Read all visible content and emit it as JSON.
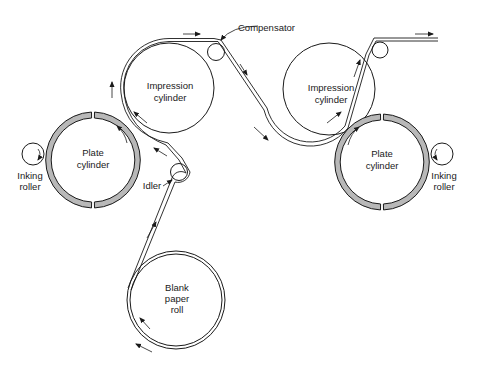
{
  "diagram": {
    "type": "printing-press-schematic",
    "colors": {
      "line": "#1a1a1a",
      "plate_fill": "#b8b8b8",
      "background": "#ffffff"
    },
    "labels": {
      "compensator": "Compensator",
      "idler": "Idler",
      "impression_left_1": "Impression",
      "impression_left_2": "cylinder",
      "impression_right_1": "Impression",
      "impression_right_2": "cylinder",
      "plate_left_1": "Plate",
      "plate_left_2": "cylinder",
      "plate_right_1": "Plate",
      "plate_right_2": "cylinder",
      "inking_left_1": "Inking",
      "inking_left_2": "roller",
      "inking_right_1": "Inking",
      "inking_right_2": "roller",
      "blank_1": "Blank",
      "blank_2": "paper",
      "blank_3": "roll"
    },
    "components": [
      {
        "id": "blank-paper-roll",
        "label": "Blank paper roll"
      },
      {
        "id": "idler",
        "label": "Idler"
      },
      {
        "id": "impression-cylinder-left",
        "label": "Impression cylinder"
      },
      {
        "id": "plate-cylinder-left",
        "label": "Plate cylinder"
      },
      {
        "id": "inking-roller-left",
        "label": "Inking roller"
      },
      {
        "id": "compensator",
        "label": "Compensator"
      },
      {
        "id": "impression-cylinder-right",
        "label": "Impression cylinder"
      },
      {
        "id": "plate-cylinder-right",
        "label": "Plate cylinder"
      },
      {
        "id": "inking-roller-right",
        "label": "Inking roller"
      },
      {
        "id": "exit-roller",
        "label": ""
      }
    ],
    "edges": [
      {
        "from": "blank-paper-roll",
        "to": "idler",
        "label": "paper web"
      },
      {
        "from": "idler",
        "to": "impression-cylinder-left",
        "label": "paper web"
      },
      {
        "from": "impression-cylinder-left",
        "to": "compensator",
        "label": "paper web"
      },
      {
        "from": "compensator",
        "to": "impression-cylinder-right",
        "label": "paper web"
      },
      {
        "from": "impression-cylinder-right",
        "to": "exit-roller",
        "label": "paper web"
      },
      {
        "from": "inking-roller-left",
        "to": "plate-cylinder-left",
        "label": "ink"
      },
      {
        "from": "inking-roller-right",
        "to": "plate-cylinder-right",
        "label": "ink"
      }
    ]
  }
}
